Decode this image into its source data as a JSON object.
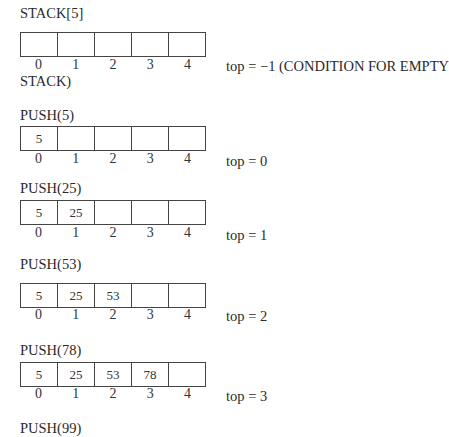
{
  "title": "STACK[5]",
  "indices": [
    "0",
    "1",
    "2",
    "3",
    "4"
  ],
  "initial": {
    "cells": [
      "",
      "",
      "",
      "",
      ""
    ],
    "top_text": "top = −1 (CONDITION FOR EMPTY",
    "top_text_cont": "STACK)"
  },
  "steps": [
    {
      "label": "PUSH(5)",
      "cells": [
        "5",
        "",
        "",
        "",
        ""
      ],
      "top_text": "top = 0"
    },
    {
      "label": "PUSH(25)",
      "cells": [
        "5",
        "25",
        "",
        "",
        ""
      ],
      "top_text": "top = 1"
    },
    {
      "label": "PUSH(53)",
      "cells": [
        "5",
        "25",
        "53",
        "",
        ""
      ],
      "top_text": "top = 2"
    },
    {
      "label": "PUSH(78)",
      "cells": [
        "5",
        "25",
        "53",
        "78",
        ""
      ],
      "top_text": "top = 3"
    }
  ],
  "last_label": "PUSH(99)"
}
